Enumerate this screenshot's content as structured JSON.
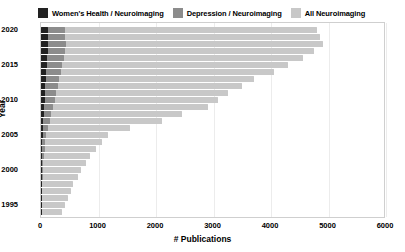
{
  "chart_data": {
    "type": "bar",
    "orientation": "horizontal",
    "title": "",
    "xlabel": "# Publications",
    "ylabel": "Year",
    "xlim": [
      0,
      6000
    ],
    "ylim": [
      1993,
      2021
    ],
    "xticks": [
      0,
      1000,
      2000,
      3000,
      4000,
      5000,
      6000
    ],
    "yticks": [
      1995,
      2000,
      2005,
      2010,
      2015,
      2020
    ],
    "grid": true,
    "legend_position": "top",
    "categories": [
      1994,
      1995,
      1996,
      1997,
      1998,
      1999,
      2000,
      2001,
      2002,
      2003,
      2004,
      2005,
      2006,
      2007,
      2008,
      2009,
      2010,
      2011,
      2012,
      2013,
      2014,
      2015,
      2016,
      2017,
      2018,
      2019,
      2020
    ],
    "series": [
      {
        "name": "All Neuroimaging",
        "color": "#c8c8c8",
        "values": [
          360,
          420,
          470,
          520,
          560,
          640,
          700,
          780,
          860,
          960,
          1060,
          1170,
          1540,
          2100,
          2450,
          2900,
          3080,
          3250,
          3500,
          3700,
          4050,
          4300,
          4550,
          4750,
          4900,
          4850,
          4800
        ]
      },
      {
        "name": "Depression / Neuroimaging",
        "color": "#8c8c8c",
        "values": [
          10,
          12,
          14,
          18,
          22,
          28,
          34,
          42,
          50,
          62,
          76,
          92,
          120,
          150,
          180,
          210,
          235,
          260,
          290,
          315,
          345,
          370,
          395,
          415,
          430,
          425,
          415
        ]
      },
      {
        "name": "Women's Health / Neuroimaging",
        "color": "#222222",
        "values": [
          2,
          3,
          4,
          5,
          6,
          8,
          10,
          12,
          15,
          18,
          22,
          27,
          33,
          40,
          47,
          55,
          62,
          70,
          78,
          86,
          95,
          103,
          112,
          120,
          128,
          126,
          122
        ]
      }
    ]
  },
  "legend": {
    "items": [
      {
        "label": "Women's Health / Neuroimaging",
        "color": "#222222"
      },
      {
        "label": "Depression / Neuroimaging",
        "color": "#8c8c8c"
      },
      {
        "label": "All Neuroimaging",
        "color": "#c8c8c8"
      }
    ]
  },
  "axes": {
    "y_title": "Year",
    "x_title": "# Publications"
  }
}
